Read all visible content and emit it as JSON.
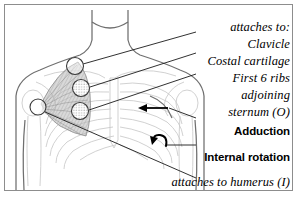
{
  "figure": {
    "frame_color": "#8d8d8d",
    "background": "#ffffff",
    "ink_color": "#000000",
    "body_outline_color": "#6f6f6f",
    "skeleton_color": "#c8c8c8",
    "muscle_fill_color": "#b0b0b0"
  },
  "labels": {
    "attaches_to_header": "attaches to:",
    "origin_1": "Clavicle",
    "origin_2": "Costal cartilage",
    "origin_3": "First 6 ribs",
    "origin_4": "adjoining",
    "origin_5": "sternum (O)",
    "action_1": "Adduction",
    "action_2": "Internal rotation",
    "insertion": "attaches to humerus (I)"
  },
  "markers": [
    {
      "name": "clavicle-attachment-point",
      "x": 75,
      "y": 66,
      "r": 8.5,
      "shaded": false
    },
    {
      "name": "costal-cartilage-attachment-point",
      "x": 81,
      "y": 88,
      "r": 8.5,
      "shaded": true
    },
    {
      "name": "ribs-attachment-point",
      "x": 80,
      "y": 111,
      "r": 8.5,
      "shaded": true
    },
    {
      "name": "humerus-attachment-point",
      "x": 38,
      "y": 107,
      "r": 8.0,
      "shaded": false
    }
  ],
  "arrows": {
    "adduction_arrow": "left-pointing straight arrow",
    "internal_rotation_arrow": "counter-clockwise curved arrow"
  }
}
